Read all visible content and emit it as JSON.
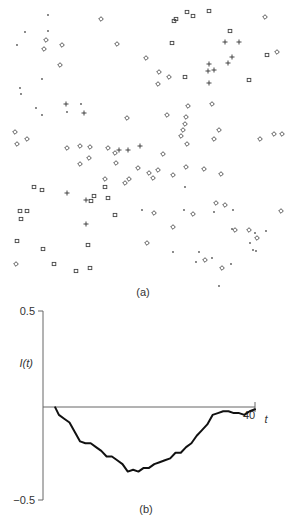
{
  "figure": {
    "panel_a_label": "(a)",
    "panel_b_label": "(b)"
  },
  "chart_data": [
    {
      "type": "scatter",
      "title": "(a)",
      "xlabel": "",
      "ylabel": "",
      "axes": "none",
      "series": [
        {
          "name": "diamond",
          "marker": "diamond",
          "points": [
            [
              101,
              19
            ],
            [
              46,
              40
            ],
            [
              44,
              49
            ],
            [
              62,
              45
            ],
            [
              117,
              44
            ],
            [
              15,
              132
            ],
            [
              60,
              65
            ],
            [
              27,
              139
            ],
            [
              17,
              144
            ],
            [
              80,
              146
            ],
            [
              67,
              148
            ],
            [
              90,
              147
            ],
            [
              108,
              148
            ],
            [
              146,
              58
            ],
            [
              159,
              72
            ],
            [
              158,
              84
            ],
            [
              169,
              77
            ],
            [
              212,
              104
            ],
            [
              185,
              124
            ],
            [
              183,
              130
            ],
            [
              186,
              117
            ],
            [
              187,
              144
            ],
            [
              181,
              136
            ],
            [
              188,
              106
            ],
            [
              282,
              134
            ],
            [
              127,
              118
            ],
            [
              167,
              115
            ],
            [
              214,
              139
            ],
            [
              219,
              130
            ],
            [
              260,
              139
            ],
            [
              274,
              134
            ],
            [
              265,
              17
            ],
            [
              277,
              52
            ],
            [
              204,
              169
            ],
            [
              186,
              167
            ],
            [
              173,
              175
            ],
            [
              158,
              170
            ],
            [
              153,
              178
            ],
            [
              221,
              174
            ],
            [
              115,
              153
            ],
            [
              116,
              163
            ],
            [
              89,
              158
            ],
            [
              80,
              164
            ],
            [
              129,
              179
            ],
            [
              105,
              179
            ],
            [
              125,
              183
            ],
            [
              149,
              173
            ],
            [
              138,
              168
            ],
            [
              163,
              154
            ],
            [
              216,
              203
            ],
            [
              193,
              214
            ],
            [
              235,
              230
            ],
            [
              249,
              230
            ],
            [
              257,
              238
            ],
            [
              225,
              205
            ],
            [
              205,
              260
            ],
            [
              173,
              227
            ],
            [
              16,
              264
            ],
            [
              147,
              243
            ],
            [
              222,
              268
            ],
            [
              281,
              211
            ],
            [
              154,
              213
            ]
          ],
          "symbol": "◇"
        },
        {
          "name": "square",
          "marker": "square",
          "points": [
            [
              187,
              12
            ],
            [
              209,
              11
            ],
            [
              193,
              16
            ],
            [
              176,
              19
            ],
            [
              174,
              21
            ],
            [
              230,
              31
            ],
            [
              172,
              43
            ],
            [
              267,
              55
            ],
            [
              185,
              77
            ],
            [
              249,
              80
            ],
            [
              34,
              187
            ],
            [
              42,
              190
            ],
            [
              94,
              196
            ],
            [
              91,
              201
            ],
            [
              20,
              211
            ],
            [
              27,
              211
            ],
            [
              21,
              219
            ],
            [
              17,
              241
            ],
            [
              43,
              249
            ],
            [
              54,
              264
            ],
            [
              76,
              271
            ],
            [
              90,
              268
            ],
            [
              88,
              245
            ],
            [
              108,
              198
            ],
            [
              115,
              215
            ],
            [
              105,
              187
            ]
          ],
          "symbol": "□"
        },
        {
          "name": "plus",
          "marker": "plus",
          "points": [
            [
              225,
              42
            ],
            [
              239,
              42
            ],
            [
              232,
              57
            ],
            [
              228,
              63
            ],
            [
              214,
              70
            ],
            [
              209,
              64
            ],
            [
              208,
              71
            ],
            [
              209,
              83
            ],
            [
              86,
              200
            ],
            [
              86,
              224
            ],
            [
              67,
              193
            ],
            [
              140,
              146
            ],
            [
              128,
              150
            ],
            [
              119,
              150
            ],
            [
              84,
              113
            ],
            [
              66,
              104
            ]
          ],
          "symbol": "+"
        },
        {
          "name": "dot",
          "marker": "dot",
          "points": [
            [
              48,
              15
            ],
            [
              48,
              31
            ],
            [
              25,
              32
            ],
            [
              17,
              45
            ],
            [
              42,
              79
            ],
            [
              20,
              88
            ],
            [
              21,
              94
            ],
            [
              36,
              108
            ],
            [
              42,
              115
            ],
            [
              81,
              104
            ],
            [
              67,
              112
            ],
            [
              185,
              187
            ],
            [
              184,
              210
            ],
            [
              233,
              210
            ],
            [
              214,
              212
            ],
            [
              232,
              229
            ],
            [
              255,
              233
            ],
            [
              250,
              243
            ],
            [
              256,
              251
            ],
            [
              173,
              252
            ],
            [
              199,
              252
            ],
            [
              212,
              258
            ],
            [
              196,
              262
            ],
            [
              231,
              264
            ],
            [
              219,
              286
            ],
            [
              142,
              210
            ],
            [
              253,
              250
            ],
            [
              266,
              231
            ]
          ],
          "symbol": "·"
        }
      ]
    },
    {
      "type": "line",
      "title": "(b)",
      "xlabel": "t",
      "ylabel": "I(t)",
      "xlim": [
        0,
        40
      ],
      "ylim": [
        -0.5,
        0.5
      ],
      "yticks": [
        "0.5",
        "-0.5"
      ],
      "xticks": [
        "40"
      ],
      "grid": false,
      "series": [
        {
          "name": "I(t)",
          "x": [
            2.3,
            3,
            4,
            5,
            6,
            7,
            8,
            9,
            10,
            11,
            12,
            13,
            14,
            15,
            16,
            17,
            18,
            19,
            20,
            21,
            22,
            23,
            24,
            25,
            26,
            27,
            28,
            29,
            30,
            31,
            32,
            33,
            34,
            35,
            36,
            37,
            38,
            39,
            40
          ],
          "values": [
            -0.01,
            -0.05,
            -0.07,
            -0.09,
            -0.14,
            -0.19,
            -0.2,
            -0.2,
            -0.22,
            -0.24,
            -0.27,
            -0.27,
            -0.29,
            -0.31,
            -0.35,
            -0.34,
            -0.35,
            -0.33,
            -0.33,
            -0.31,
            -0.3,
            -0.29,
            -0.28,
            -0.25,
            -0.25,
            -0.22,
            -0.2,
            -0.16,
            -0.13,
            -0.1,
            -0.05,
            -0.04,
            -0.03,
            -0.03,
            -0.04,
            -0.04,
            -0.05,
            -0.03,
            -0.02
          ]
        }
      ]
    }
  ]
}
